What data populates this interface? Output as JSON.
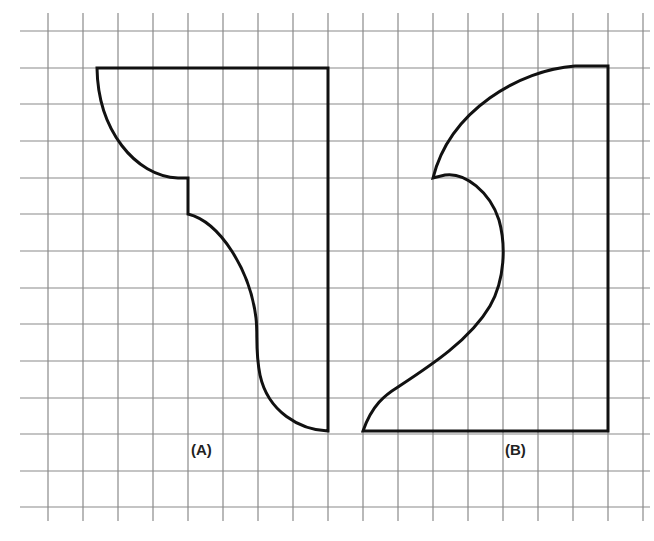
{
  "figure": {
    "type": "grid-templates",
    "colors": {
      "background": "#ffffff",
      "grid": "#8a8a8a",
      "outline": "#111111",
      "label": "#222222"
    },
    "grid": {
      "columns": 18,
      "rows": 14
    },
    "shapes": [
      {
        "id": "A",
        "label": "(A)"
      },
      {
        "id": "B",
        "label": "(B)"
      }
    ]
  }
}
